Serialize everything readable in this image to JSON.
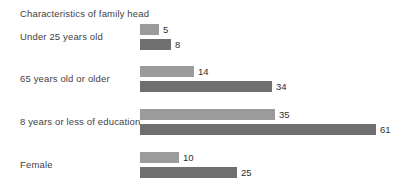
{
  "chart_data": {
    "type": "bar",
    "orientation": "horizontal",
    "title": "Characteristics of family head",
    "xlabel": "",
    "ylabel": "",
    "grid": false,
    "legend": null,
    "xlim": [
      0,
      61
    ],
    "categories": [
      "Under 25 years old",
      "65 years old or older",
      "8 years or less of education",
      "Female"
    ],
    "series": [
      {
        "name": "series-light",
        "color": "#9b9b9b",
        "values": [
          5,
          14,
          35,
          10
        ]
      },
      {
        "name": "series-dark",
        "color": "#6f6f6f",
        "values": [
          8,
          34,
          61,
          25
        ]
      }
    ],
    "value_labels": {
      "light": [
        "5",
        "14",
        "35",
        "10"
      ],
      "dark": [
        "8",
        "34",
        "61",
        "25"
      ]
    }
  },
  "scale": {
    "px_per_unit": 3.87,
    "bar_origin_x": 140
  }
}
